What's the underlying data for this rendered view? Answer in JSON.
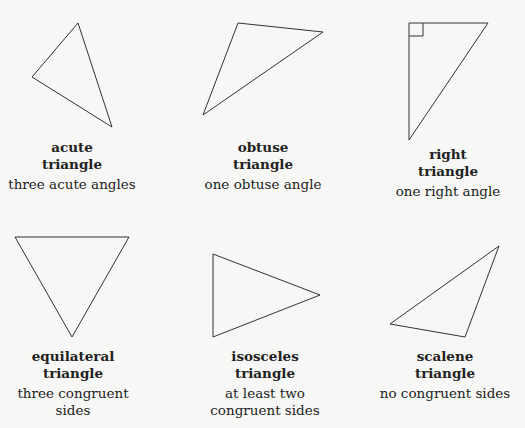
{
  "diagram": {
    "stroke_color": "#333333",
    "background": "#f7f7f5",
    "triangles": [
      {
        "id": "acute",
        "name_line1": "acute",
        "name_line2": "triangle",
        "desc_line1": "three acute angles",
        "desc_line2": "",
        "points": "78,23 32,77 112,127"
      },
      {
        "id": "obtuse",
        "name_line1": "obtuse",
        "name_line2": "triangle",
        "desc_line1": "one obtuse angle",
        "desc_line2": "",
        "points": "238,23 323,32 203,115"
      },
      {
        "id": "right",
        "name_line1": "right",
        "name_line2": "triangle",
        "desc_line1": "one right angle",
        "desc_line2": "",
        "points": "409,23 488,23 409,140",
        "right_angle_marker": "409,36 423,36 423,23"
      },
      {
        "id": "equilateral",
        "name_line1": "equilateral",
        "name_line2": "triangle",
        "desc_line1": "three congruent",
        "desc_line2": "sides",
        "points": "15,237 129,237 72,337"
      },
      {
        "id": "isosceles",
        "name_line1": "isosceles",
        "name_line2": "triangle",
        "desc_line1": "at least two",
        "desc_line2": "congruent sides",
        "points": "213,254 320,295 213,337"
      },
      {
        "id": "scalene",
        "name_line1": "scalene",
        "name_line2": "triangle",
        "desc_line1": "no congruent sides",
        "desc_line2": "",
        "points": "499,246 390,324 465,337"
      }
    ]
  }
}
